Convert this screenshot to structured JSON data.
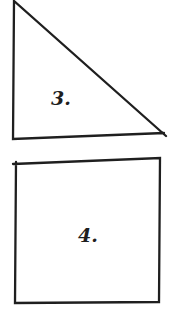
{
  "canvas": {
    "width": 171,
    "height": 317,
    "background": "#ffffff",
    "ink": "#1f1f1f"
  },
  "shapes": [
    {
      "id": "triangle",
      "type": "right-triangle",
      "label": "3.",
      "points": [
        [
          166,
          136
        ],
        [
          14,
          1
        ],
        [
          13,
          139
        ],
        [
          164,
          133
        ]
      ],
      "label_pos": [
        51,
        105
      ]
    },
    {
      "id": "square",
      "type": "quadrilateral",
      "label": "4.",
      "points": [
        [
          13,
          164
        ],
        [
          160,
          158
        ],
        [
          159,
          302
        ],
        [
          15,
          303
        ],
        [
          16,
          162
        ]
      ],
      "label_pos": [
        78,
        242
      ]
    }
  ]
}
